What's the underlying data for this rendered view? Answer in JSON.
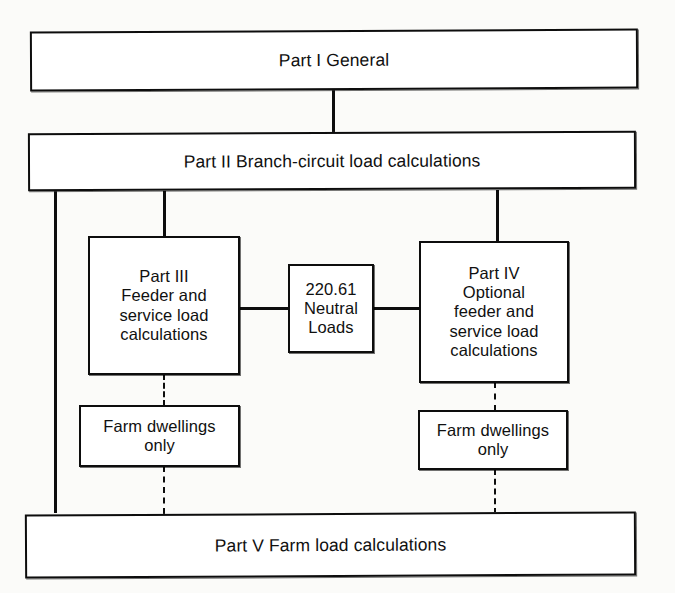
{
  "diagram": {
    "background_color": "#fbfbf9",
    "line_color": "#0d0d0d",
    "box_fill": "#ffffff",
    "nodes": {
      "part1": {
        "label": "Part I General"
      },
      "part2": {
        "label": "Part II Branch-circuit load calculations"
      },
      "part3": {
        "label": "Part III\nFeeder and\nservice load\ncalculations"
      },
      "neutral": {
        "label": "220.61\nNeutral\nLoads"
      },
      "part4": {
        "label": "Part IV\nOptional\nfeeder and\nservice load\ncalculations"
      },
      "farm_left": {
        "label": "Farm dwellings\nonly"
      },
      "farm_right": {
        "label": "Farm dwellings\nonly"
      },
      "part5": {
        "label": "Part V Farm load calculations"
      }
    },
    "connectors": [
      {
        "name": "part1-to-part2",
        "style": "solid",
        "orientation": "vertical"
      },
      {
        "name": "part2-left-trunk-to-part5",
        "style": "solid",
        "orientation": "vertical"
      },
      {
        "name": "part2-to-part3",
        "style": "solid",
        "orientation": "vertical"
      },
      {
        "name": "part2-to-part4",
        "style": "solid",
        "orientation": "vertical"
      },
      {
        "name": "part3-to-neutral",
        "style": "solid",
        "orientation": "horizontal"
      },
      {
        "name": "neutral-to-part4",
        "style": "solid",
        "orientation": "horizontal"
      },
      {
        "name": "part3-to-farm-left",
        "style": "dashed",
        "orientation": "vertical"
      },
      {
        "name": "farm-left-to-part5",
        "style": "dashed",
        "orientation": "vertical"
      },
      {
        "name": "part4-to-farm-right",
        "style": "dashed",
        "orientation": "vertical"
      },
      {
        "name": "farm-right-to-part5",
        "style": "dashed",
        "orientation": "vertical"
      }
    ]
  }
}
